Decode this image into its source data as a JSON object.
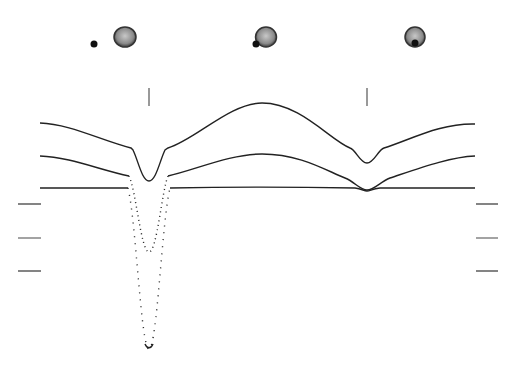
{
  "diagram": {
    "type": "eclipsing-binary-light-curve",
    "panels": [
      {
        "label": "primary-eclipse-phase",
        "star_x": 125,
        "star_y": 37,
        "companion_x": 94,
        "companion_y": 44
      },
      {
        "label": "quadrature-phase",
        "star_x": 265,
        "star_y": 37,
        "companion_x": 256,
        "companion_y": 44
      },
      {
        "label": "secondary-eclipse-phase",
        "star_x": 415,
        "star_y": 37,
        "companion_x": 415,
        "companion_y": 43
      }
    ],
    "phase_ticks_x": [
      149,
      367
    ],
    "left_scale_marks_y": [
      204,
      238,
      271
    ],
    "right_scale_marks_y": [
      204,
      238,
      271
    ],
    "curves": [
      {
        "name": "top-light-curve",
        "baseline_y": 123,
        "primary_min_y": 181,
        "secondary_min_y": 163
      },
      {
        "name": "middle-light-curve",
        "baseline_y": 156,
        "primary_min_y": 252,
        "secondary_min_y": 190
      },
      {
        "name": "bottom-light-curve",
        "baseline_y": 188,
        "primary_min_y": 349,
        "secondary_min_y": 190
      }
    ],
    "colors": {
      "line": "#222222",
      "star_fill": "#8a8a8a",
      "star_edge": "#333333",
      "background": "#ffffff"
    }
  }
}
